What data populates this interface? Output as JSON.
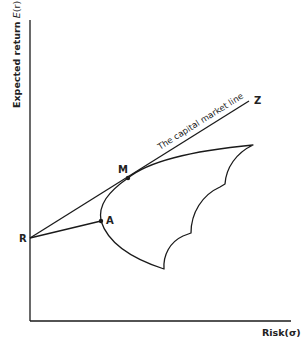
{
  "diagram": {
    "y_axis_label": "Expected return E(r)",
    "y_axis_label_prefix": "Expected return ",
    "y_axis_label_italic": "E",
    "y_axis_label_suffix": "(r)",
    "x_axis_label": "Risk(σ)",
    "line_label": "The capital market line",
    "points": {
      "R": "R",
      "A": "A",
      "M": "M",
      "Z": "Z"
    },
    "colors": {
      "stroke": "#1a1a1a",
      "background": "#ffffff"
    }
  }
}
